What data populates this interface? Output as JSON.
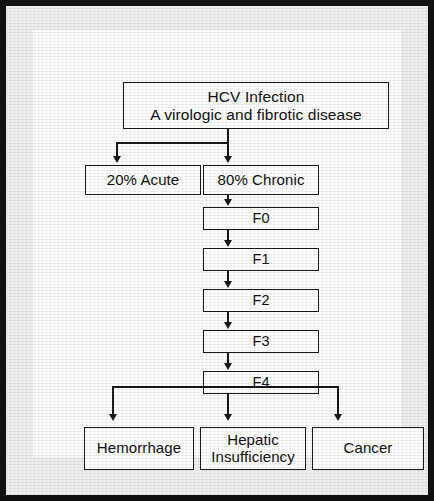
{
  "figure": {
    "type": "flowchart",
    "orientation": "top-down",
    "colors": {
      "frame": "#111111",
      "page_background": "#efefef",
      "card_background": "#fdfdfd",
      "box_border": "#1a1a1a",
      "box_fill": "#ffffff",
      "connector": "#1a1a1a",
      "text": "#111111"
    }
  },
  "nodes": {
    "title": {
      "id": "hcv-infection",
      "line1": "HCV Infection",
      "line2": "A virologic and fibrotic disease"
    },
    "acute": {
      "id": "acute",
      "label": "20% Acute",
      "percent": "20%"
    },
    "chronic": {
      "id": "chronic",
      "label": "80% Chronic",
      "percent": "80%"
    },
    "stages": [
      {
        "id": "f0",
        "label": "F0"
      },
      {
        "id": "f1",
        "label": "F1"
      },
      {
        "id": "f2",
        "label": "F2"
      },
      {
        "id": "f3",
        "label": "F3"
      },
      {
        "id": "f4",
        "label": "F4"
      }
    ],
    "outcomes": [
      {
        "id": "hemorrhage",
        "line1": "Hemorrhage",
        "line2": ""
      },
      {
        "id": "hepatic-insufficiency",
        "line1": "Hepatic",
        "line2": "Insufficiency"
      },
      {
        "id": "cancer",
        "line1": "Cancer",
        "line2": ""
      }
    ]
  },
  "edges": [
    {
      "from": "hcv-infection",
      "to": "acute",
      "arrow": "down"
    },
    {
      "from": "hcv-infection",
      "to": "chronic",
      "arrow": "down"
    },
    {
      "from": "chronic",
      "to": "f0",
      "arrow": "down"
    },
    {
      "from": "f0",
      "to": "f1",
      "arrow": "down"
    },
    {
      "from": "f1",
      "to": "f2",
      "arrow": "down"
    },
    {
      "from": "f2",
      "to": "f3",
      "arrow": "down"
    },
    {
      "from": "f3",
      "to": "f4",
      "arrow": "down"
    },
    {
      "from": "f4",
      "to": "hemorrhage",
      "arrow": "down"
    },
    {
      "from": "f4",
      "to": "hepatic-insufficiency",
      "arrow": "down"
    },
    {
      "from": "f4",
      "to": "cancer",
      "arrow": "down"
    }
  ]
}
